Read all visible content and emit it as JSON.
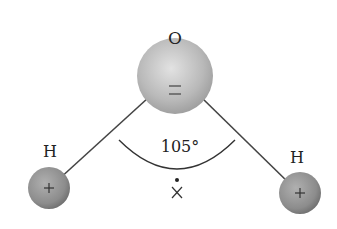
{
  "diagram": {
    "oxygen": {
      "label": "O",
      "charge": "="
    },
    "hydrogen_left": {
      "label": "H",
      "charge": "+"
    },
    "hydrogen_right": {
      "label": "H",
      "charge": "+"
    },
    "bond_angle": "105°",
    "center_marker": {
      "dot": "•",
      "cross": "×"
    },
    "colors": {
      "sphere": "#b5b5b5",
      "sphere_dark": "#8a8a8a",
      "bond": "#444444",
      "text": "#222222"
    }
  }
}
